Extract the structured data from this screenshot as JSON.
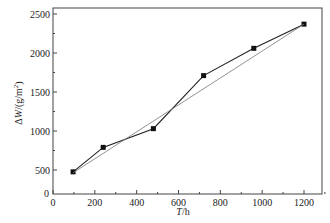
{
  "chart_data": {
    "type": "line",
    "title": "",
    "xlabel": "T/h",
    "ylabel": "ΔW/(g/m²)",
    "x_ticks": [
      "0",
      "200",
      "400",
      "600",
      "800",
      "1000",
      "1200"
    ],
    "y_ticks": [
      "0",
      "500",
      "1000",
      "1500",
      "2000",
      "2500"
    ],
    "xlim": [
      0,
      1300
    ],
    "ylim": [
      0,
      2500
    ],
    "grid": false,
    "legend": null,
    "series": [
      {
        "name": "measured",
        "style": "line-with-square-markers",
        "x": [
          96,
          240,
          480,
          720,
          960,
          1200
        ],
        "values": [
          460,
          790,
          1030,
          1710,
          2060,
          2370
        ]
      },
      {
        "name": "fit",
        "style": "thin-line",
        "x": [
          96,
          1200
        ],
        "values": [
          440,
          2370
        ]
      }
    ]
  },
  "labels": {
    "x_axis_title_italic": "T",
    "x_axis_title_rest": "/h",
    "y_axis_title_prefix": "Δ",
    "y_axis_title_italic": "W",
    "y_axis_title_rest": "/(g/m",
    "y_axis_title_sup": "2",
    "y_axis_title_close": ")"
  }
}
